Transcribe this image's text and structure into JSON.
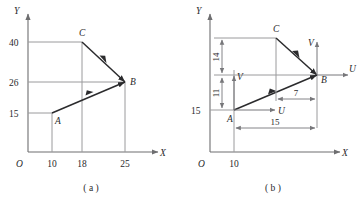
{
  "figure": {
    "panels": [
      {
        "id": "a",
        "caption": "( a )",
        "origin_label": "O",
        "x_axis_label": "X",
        "y_axis_label": "Y",
        "x_ticks": [
          "10",
          "18",
          "25"
        ],
        "y_ticks": [
          "40",
          "26",
          "15"
        ],
        "points": [
          {
            "name": "A",
            "x": 10,
            "y": 15
          },
          {
            "name": "B",
            "x": 25,
            "y": 26
          },
          {
            "name": "C",
            "x": 18,
            "y": 40
          }
        ],
        "vectors": [
          {
            "from": "A",
            "to": "B"
          },
          {
            "from": "C",
            "to": "B"
          }
        ]
      },
      {
        "id": "b",
        "caption": "( b )",
        "origin_label": "O",
        "x_axis_label": "X",
        "y_axis_label": "Y",
        "x_ticks": [
          "10"
        ],
        "y_ticks": [
          "15"
        ],
        "points": [
          {
            "name": "A",
            "x": 10,
            "y": 15
          },
          {
            "name": "B",
            "x": 25,
            "y": 26
          },
          {
            "name": "C",
            "x": 18,
            "y": 40
          }
        ],
        "vectors": [
          {
            "from": "A",
            "to": "B"
          },
          {
            "from": "C",
            "to": "B"
          }
        ],
        "local_frames": [
          {
            "at": "A",
            "u_label": "U",
            "v_label": "V"
          },
          {
            "at": "B",
            "u_label": "U",
            "v_label": "V"
          }
        ],
        "dimensions": [
          {
            "label": "14",
            "orientation": "vertical",
            "span": "B-to-C vertical"
          },
          {
            "label": "11",
            "orientation": "vertical",
            "span": "A-to-B vertical"
          },
          {
            "label": "7",
            "orientation": "horizontal",
            "span": "C-to-B horizontal"
          },
          {
            "label": "15",
            "orientation": "horizontal",
            "span": "A-to-B horizontal"
          }
        ]
      }
    ]
  },
  "colors": {
    "axis": "#6e6e70",
    "guide": "#9a9a9c",
    "vector": "#2b2b2d",
    "dimension": "#77777a",
    "text": "#28282a",
    "background": "#ffffff"
  }
}
